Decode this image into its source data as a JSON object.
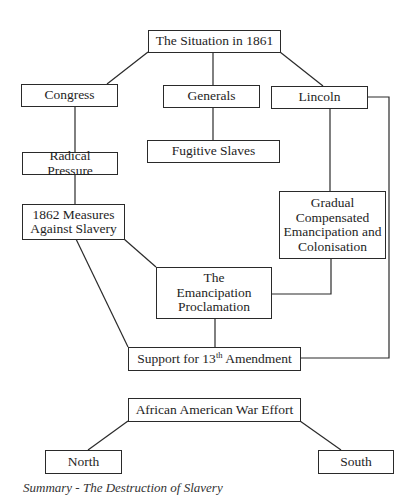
{
  "diagram": {
    "nodes": {
      "situation": "The Situation in 1861",
      "congress": "Congress",
      "generals": "Generals",
      "lincoln": "Lincoln",
      "fugitive": "Fugitive Slaves",
      "radical": "Radical Pressure",
      "measures_1": "1862 Measures",
      "measures_2": "Against Slavery",
      "gradual_1": "Gradual",
      "gradual_2": "Compensated",
      "gradual_3": "Emancipation and",
      "gradual_4": "Colonisation",
      "emancipation_1": "The",
      "emancipation_2": "Emancipation",
      "emancipation_3": "Proclamation",
      "support_pre": "Support for 13",
      "support_sup": "th",
      "support_post": " Amendment",
      "african": "African American War Effort",
      "north": "North",
      "south": "South"
    },
    "edges": [
      [
        "situation",
        "congress"
      ],
      [
        "situation",
        "generals"
      ],
      [
        "situation",
        "lincoln"
      ],
      [
        "generals",
        "fugitive"
      ],
      [
        "congress",
        "radical"
      ],
      [
        "radical",
        "measures"
      ],
      [
        "lincoln",
        "gradual"
      ],
      [
        "lincoln",
        "support"
      ],
      [
        "measures",
        "emancipation"
      ],
      [
        "measures",
        "support"
      ],
      [
        "gradual",
        "emancipation"
      ],
      [
        "emancipation",
        "support"
      ],
      [
        "african",
        "north"
      ],
      [
        "african",
        "south"
      ]
    ],
    "caption": "Summary - The Destruction of Slavery"
  }
}
